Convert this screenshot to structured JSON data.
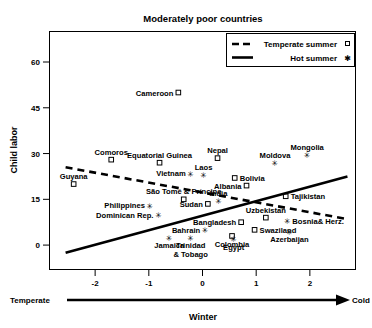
{
  "chart_data": {
    "type": "scatter",
    "title": "Moderately poor countries",
    "xlabel": "Winter",
    "ylabel": "Child labor",
    "x_axis_left_label": "Temperate",
    "x_axis_right_label": "Cold",
    "xticks": [
      -2,
      -1,
      0,
      1,
      2
    ],
    "xtick_labels": [
      "-2",
      "-1",
      "0",
      "1",
      "2"
    ],
    "yticks": [
      0,
      15,
      30,
      45,
      60
    ],
    "ytick_labels": [
      "0",
      "15",
      "30",
      "45",
      "60"
    ],
    "xlim": [
      -2.85,
      2.85
    ],
    "ylim": [
      -8,
      70
    ],
    "grid": false,
    "legend_position": "top-right",
    "series": [
      {
        "name": "Temperate summer",
        "marker": "square",
        "line_style": "dashed",
        "points": [
          {
            "label": "Cameroon",
            "x": -0.45,
            "y": 50.0,
            "label_pos": "left"
          },
          {
            "label": "Comoros",
            "x": -1.7,
            "y": 28.0,
            "label_pos": "above"
          },
          {
            "label": "Equatorial Guinea",
            "x": -0.8,
            "y": 27.0,
            "label_pos": "above"
          },
          {
            "label": "Guyana",
            "x": -2.4,
            "y": 20.0,
            "label_pos": "above"
          },
          {
            "label": "Nepal",
            "x": 0.28,
            "y": 28.5,
            "label_pos": "above"
          },
          {
            "label": "Bolivia",
            "x": 0.6,
            "y": 22.0,
            "label_pos": "right"
          },
          {
            "label": "Albania",
            "x": 0.82,
            "y": 19.5,
            "label_pos": "left"
          },
          {
            "label": "Tajikistan",
            "x": 1.55,
            "y": 16.0,
            "label_pos": "right"
          },
          {
            "label": "São Tomé & Príncipe",
            "x": -0.35,
            "y": 15.0,
            "label_pos": "above"
          },
          {
            "label": "Sudan",
            "x": 0.1,
            "y": 13.5,
            "label_pos": "left"
          },
          {
            "label": "Bangladesh",
            "x": 0.72,
            "y": 7.5,
            "label_pos": "left"
          },
          {
            "label": "Uzbekistan",
            "x": 1.18,
            "y": 9.0,
            "label_pos": "above"
          },
          {
            "label": "Swaziland",
            "x": 0.97,
            "y": 5.0,
            "label_pos": "right"
          },
          {
            "label": "Colombia",
            "x": 0.55,
            "y": 3.0,
            "label_pos": "below"
          }
        ],
        "fit_line": {
          "x0": -2.55,
          "y0": 25.5,
          "x1": 2.7,
          "y1": 8.5
        }
      },
      {
        "name": "Hot summer",
        "marker": "star",
        "line_style": "solid",
        "points": [
          {
            "label": "Vietnam",
            "x": -0.22,
            "y": 23.5,
            "label_pos": "left"
          },
          {
            "label": "Laos",
            "x": 0.02,
            "y": 23.0,
            "label_pos": "above"
          },
          {
            "label": "Moldova",
            "x": 1.35,
            "y": 27.0,
            "label_pos": "above"
          },
          {
            "label": "Mongolia",
            "x": 1.95,
            "y": 29.5,
            "label_pos": "above"
          },
          {
            "label": "India",
            "x": 0.3,
            "y": 14.5,
            "label_pos": "above"
          },
          {
            "label": "Philippines",
            "x": -0.98,
            "y": 13.0,
            "label_pos": "left"
          },
          {
            "label": "Dominican Rep.",
            "x": -0.82,
            "y": 10.0,
            "label_pos": "left"
          },
          {
            "label": "Bosnia& Herz.",
            "x": 1.58,
            "y": 8.0,
            "label_pos": "right"
          },
          {
            "label": "Azerbaijan",
            "x": 1.62,
            "y": 4.5,
            "label_pos": "below"
          },
          {
            "label": "Bahrain",
            "x": 0.05,
            "y": 5.0,
            "label_pos": "left"
          },
          {
            "label": "Egypt",
            "x": 0.58,
            "y": 2.0,
            "label_pos": "below"
          },
          {
            "label": "Jamaica",
            "x": -0.62,
            "y": 2.5,
            "label_pos": "below"
          },
          {
            "label": "Trinidad & Tobago",
            "x": -0.22,
            "y": 2.5,
            "label_pos": "below"
          }
        ],
        "fit_line": {
          "x0": -2.55,
          "y0": -2.5,
          "x1": 2.7,
          "y1": 22.5
        }
      }
    ],
    "legend": [
      {
        "label": "Temperate summer",
        "marker": "square",
        "line_style": "dashed"
      },
      {
        "label": "Hot summer",
        "marker": "star",
        "line_style": "solid"
      }
    ]
  }
}
